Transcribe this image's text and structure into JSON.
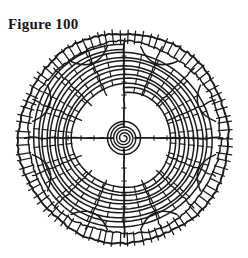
{
  "plate": {
    "caption": "Figure 100",
    "background_color": "#ffffff",
    "ink_color": "#1a1a1a",
    "subject": "orb-spider-web-diagram",
    "width": 248,
    "height": 258
  },
  "figure": {
    "center_x": 124,
    "center_y": 138,
    "outer_radius": 105,
    "hub_radius": 14,
    "hub_rings": 4,
    "radii_count": 16,
    "cardinal_spokes": 4,
    "spiral_turns": 5,
    "frame_rings": 2,
    "free_zone_radius": 44,
    "labels": {
      "outer_frame": "outer-frame-thread",
      "radius": "radial-spoke-thread",
      "spiral": "capture-spiral-thread",
      "hub": "hub-spiral"
    }
  },
  "chart_data": {
    "type": "scatter",
    "title": "Figure 100",
    "xlabel": "",
    "ylabel": "",
    "grid": false,
    "legend": "none",
    "categories": [
      "hub",
      "free-zone",
      "capture-spiral",
      "frame"
    ],
    "values": [
      14,
      44,
      98,
      105
    ]
  }
}
